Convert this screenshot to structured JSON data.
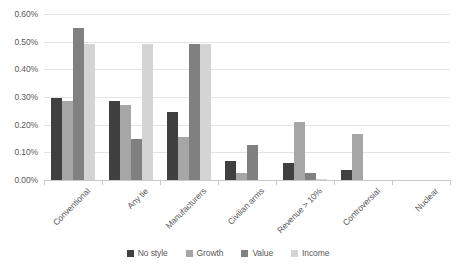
{
  "chart_data": {
    "type": "bar",
    "title": "",
    "subtitle": "",
    "xlabel": "",
    "ylabel": "",
    "ylim": [
      0,
      0.6
    ],
    "ytick_labels": [
      "0.60%",
      "0.50%",
      "0.40%",
      "0.30%",
      "0.20%",
      "0.10%",
      "0.00%"
    ],
    "ytick_values": [
      0.6,
      0.5,
      0.4,
      0.3,
      0.2,
      0.1,
      0.0
    ],
    "grid": true,
    "legend_position": "bottom",
    "value_suffix": "%",
    "categories": [
      "Conventional",
      "Any tie",
      "Manufacturers",
      "Civilian arms",
      "Revenue > 10%",
      "Controversial",
      "Nuclear"
    ],
    "series": [
      {
        "name": "No style",
        "color": "#404040",
        "values": [
          0.295,
          0.285,
          0.245,
          0.07,
          0.06,
          0.035,
          0.0
        ]
      },
      {
        "name": "Growth",
        "color": "#a6a6a6",
        "values": [
          0.285,
          0.27,
          0.155,
          0.025,
          0.21,
          0.165,
          0.0
        ]
      },
      {
        "name": "Value",
        "color": "#808080",
        "values": [
          0.55,
          0.15,
          0.49,
          0.125,
          0.025,
          0.0,
          0.0
        ]
      },
      {
        "name": "Income",
        "color": "#d4d4d4",
        "values": [
          0.49,
          0.49,
          0.49,
          0.0,
          0.005,
          0.0,
          0.0
        ]
      }
    ]
  },
  "colors": {
    "background": "#ffffff",
    "gridline": "#e4e4e4",
    "axis_line": "#c9c9c9",
    "text": "#595959"
  }
}
